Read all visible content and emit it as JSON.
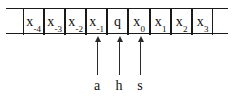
{
  "diagram": {
    "colors": {
      "ink": "#101010",
      "rule": "#1a1a1a",
      "arrow": "#2a2a2a",
      "background": "#ffffff"
    },
    "tape": {
      "cells": [
        {
          "id": "cell-blank-left",
          "base": "",
          "sub": "",
          "blank": true
        },
        {
          "id": "cell-x-minus-4",
          "base": "x",
          "sub": "-4",
          "blank": false
        },
        {
          "id": "cell-x-minus-3",
          "base": "x",
          "sub": "-3",
          "blank": false
        },
        {
          "id": "cell-x-minus-2",
          "base": "x",
          "sub": "-2",
          "blank": false
        },
        {
          "id": "cell-x-minus-1",
          "base": "x",
          "sub": "-1",
          "blank": false
        },
        {
          "id": "cell-q",
          "base": "q",
          "sub": "",
          "blank": false
        },
        {
          "id": "cell-x-0",
          "base": "x",
          "sub": "0",
          "blank": false
        },
        {
          "id": "cell-x-1",
          "base": "x",
          "sub": "1",
          "blank": false
        },
        {
          "id": "cell-x-2",
          "base": "x",
          "sub": "2",
          "blank": false
        },
        {
          "id": "cell-x-3",
          "base": "x",
          "sub": "3",
          "blank": false
        },
        {
          "id": "cell-blank-right",
          "base": "",
          "sub": "",
          "blank": true
        }
      ]
    },
    "pointers": [
      {
        "id": "pointer-a",
        "label": "a",
        "target": "cell-x-minus-1"
      },
      {
        "id": "pointer-h",
        "label": "h",
        "target": "cell-q"
      },
      {
        "id": "pointer-s",
        "label": "s",
        "target": "cell-x-0"
      }
    ]
  }
}
